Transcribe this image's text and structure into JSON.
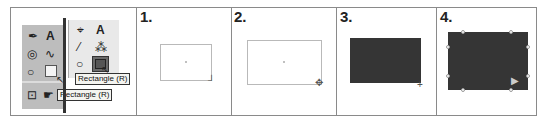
{
  "toolbox": {
    "left_tools": [
      {
        "name": "pen-tool",
        "glyph": "✒"
      },
      {
        "name": "type-tool",
        "glyph": "A"
      },
      {
        "name": "spiral-tool",
        "glyph": "◎"
      },
      {
        "name": "pencil-tool",
        "glyph": "∿"
      },
      {
        "name": "ellipse-tool",
        "glyph": "○"
      },
      {
        "name": "rectangle-tool",
        "glyph": "□"
      },
      {
        "name": "free-transform-tool",
        "glyph": "⊡"
      },
      {
        "name": "warp-tool",
        "glyph": "☛"
      }
    ],
    "right_tools": [
      {
        "name": "direct-select-tool",
        "glyph": "⌖"
      },
      {
        "name": "type-tool",
        "glyph": "A"
      },
      {
        "name": "line-tool",
        "glyph": "⁄"
      },
      {
        "name": "blob-tool",
        "glyph": "⁂"
      },
      {
        "name": "ellipse-tool",
        "glyph": "○"
      }
    ],
    "tooltip_left": "Rectangle (R)",
    "tooltip_right": "Rectangle (R)"
  },
  "steps": [
    {
      "label": "1."
    },
    {
      "label": "2."
    },
    {
      "label": "3."
    },
    {
      "label": "4."
    }
  ],
  "colors": {
    "frame": "#8a8a8a",
    "fill": "#353535",
    "outline": "#b9b9b9"
  }
}
